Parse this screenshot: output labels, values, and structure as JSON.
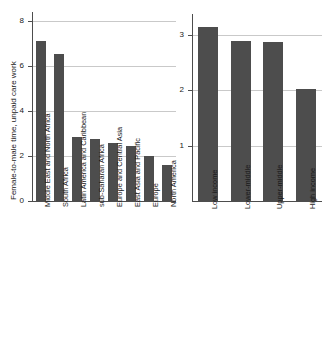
{
  "chart_data": [
    {
      "id": "left",
      "type": "bar",
      "title": "",
      "xlabel": "",
      "ylabel": "Female-to-male time, unpaid care work",
      "ylim": [
        0,
        8.4
      ],
      "yticks": [
        0,
        2,
        4,
        6,
        8
      ],
      "ytick_labels": [
        "0",
        "2",
        "4",
        "6",
        "8"
      ],
      "grid": true,
      "legend": "none",
      "bar_color": "#4d4d4d",
      "categories": [
        "Middle East and North Africa",
        "South Africa",
        "Latin America and Caribbean",
        "sub-Saharan Africa",
        "Europe and Central Asia",
        "East Asia and Pacific",
        "Europe",
        "North America"
      ],
      "values": [
        7.1,
        6.55,
        2.85,
        2.75,
        2.6,
        2.45,
        2.0,
        1.6
      ]
    },
    {
      "id": "right",
      "type": "bar",
      "title": "",
      "xlabel": "",
      "ylabel": "",
      "ylim": [
        0,
        3.38
      ],
      "yticks": [
        1,
        2,
        3
      ],
      "ytick_labels": [
        "1",
        "2",
        "3"
      ],
      "grid": true,
      "legend": "none",
      "bar_color": "#4d4d4d",
      "categories": [
        "Low income",
        "Lower-middle",
        "Upper-middle",
        "High income"
      ],
      "values": [
        3.15,
        2.9,
        2.88,
        2.02
      ]
    }
  ],
  "colors": {
    "bar": "#4d4d4d",
    "grid": "#c9c9c9",
    "axis": "#4d4d4d",
    "text": "#1a1a1a",
    "background": "#ffffff"
  }
}
